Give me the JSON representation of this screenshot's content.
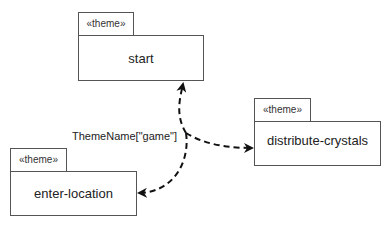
{
  "diagram": {
    "type": "theme-dependency",
    "nodes": [
      {
        "id": "start",
        "stereotype": "«theme»",
        "name": "start"
      },
      {
        "id": "distribute-crystals",
        "stereotype": "«theme»",
        "name": "distribute-crystals"
      },
      {
        "id": "enter-location",
        "stereotype": "«theme»",
        "name": "enter-location"
      }
    ],
    "edges": [
      {
        "from": "junction",
        "to": "start",
        "style": "dashed",
        "arrow": "filled"
      },
      {
        "from": "junction",
        "to": "distribute-crystals",
        "style": "dashed",
        "arrow": "filled"
      },
      {
        "from": "junction",
        "to": "enter-location",
        "style": "dashed",
        "arrow": "filled"
      }
    ],
    "edge_label": "ThemeName[\"game\"]"
  }
}
